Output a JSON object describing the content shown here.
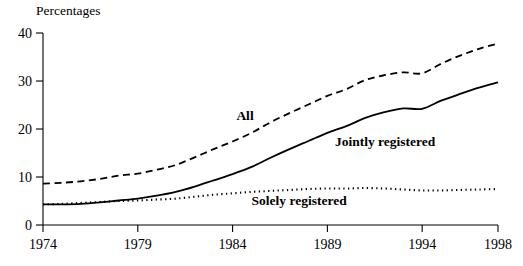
{
  "chart_data": {
    "type": "line",
    "title": "",
    "ylabel": "Percentages",
    "xlabel": "",
    "xlim": [
      1974,
      1998
    ],
    "ylim": [
      0,
      40
    ],
    "grid": false,
    "legend_position": "inline-annotations",
    "x_ticks": [
      1974,
      1979,
      1984,
      1989,
      1994,
      1998
    ],
    "y_ticks": [
      0,
      10,
      20,
      30,
      40
    ],
    "x": [
      1974,
      1975,
      1976,
      1977,
      1978,
      1979,
      1980,
      1981,
      1982,
      1983,
      1984,
      1985,
      1986,
      1987,
      1988,
      1989,
      1990,
      1991,
      1992,
      1993,
      1994,
      1995,
      1996,
      1997,
      1998
    ],
    "series": [
      {
        "name": "All",
        "style": "dashed",
        "color": "#000000",
        "label_x": 1984.2,
        "label_y": 21.8,
        "values": [
          8.6,
          8.8,
          9.1,
          9.6,
          10.3,
          10.7,
          11.5,
          12.5,
          14.1,
          15.8,
          17.4,
          19.2,
          21.4,
          23.3,
          25.1,
          26.9,
          28.3,
          30.2,
          31.2,
          31.8,
          31.6,
          33.6,
          35.3,
          36.7,
          37.8
        ]
      },
      {
        "name": "Jointly registered",
        "style": "solid",
        "color": "#000000",
        "label_x": 1989.4,
        "label_y": 16.4,
        "values": [
          4.3,
          4.3,
          4.4,
          4.7,
          5.1,
          5.5,
          6.1,
          6.9,
          8.0,
          9.3,
          10.6,
          12.1,
          14.0,
          15.8,
          17.5,
          19.2,
          20.6,
          22.3,
          23.5,
          24.3,
          24.2,
          25.9,
          27.3,
          28.6,
          29.7
        ]
      },
      {
        "name": "Solely registered",
        "style": "dotted",
        "color": "#000000",
        "label_x": 1985.0,
        "label_y": 4.2,
        "values": [
          4.3,
          4.4,
          4.6,
          4.8,
          5.0,
          5.1,
          5.3,
          5.5,
          5.9,
          6.3,
          6.6,
          6.9,
          7.1,
          7.3,
          7.5,
          7.6,
          7.6,
          7.7,
          7.6,
          7.4,
          7.2,
          7.2,
          7.3,
          7.4,
          7.5
        ]
      }
    ]
  },
  "axis": {
    "y_title": "Percentages"
  }
}
